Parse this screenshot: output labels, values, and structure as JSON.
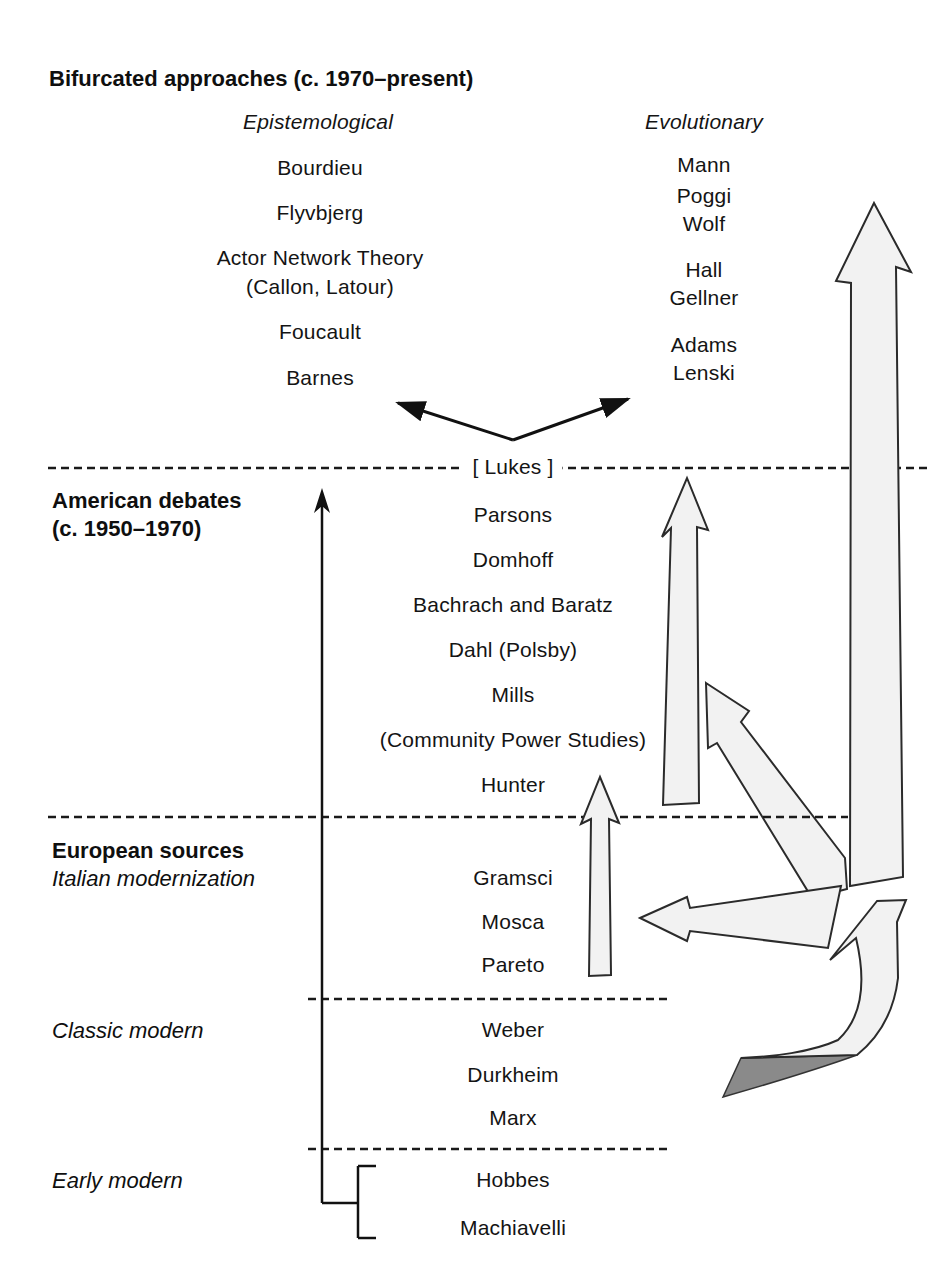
{
  "figure": {
    "title": "Bifurcated approaches (c. 1970–present)",
    "bifurcated": {
      "epistemological": {
        "label": "Epistemological",
        "names": [
          "Bourdieu",
          "Flyvbjerg",
          "Actor Network Theory",
          "(Callon, Latour)",
          "Foucault",
          "Barnes"
        ]
      },
      "evolutionary": {
        "label": "Evolutionary",
        "names": [
          "Mann",
          "Poggi",
          "Wolf",
          "Hall",
          "Gellner",
          "Adams",
          "Lenski"
        ]
      }
    },
    "lukes_label": "[ Lukes ]",
    "american": {
      "label": "American debates",
      "sublabel": "(c. 1950–1970)",
      "names": [
        "Parsons",
        "Domhoff",
        "Bachrach and Baratz",
        "Dahl (Polsby)",
        "Mills",
        "(Community Power Studies)",
        "Hunter"
      ]
    },
    "european": {
      "label": "European sources",
      "sublabel": "Italian modernization",
      "names": [
        "Gramsci",
        "Mosca",
        "Pareto"
      ]
    },
    "classic_modern": {
      "label": "Classic modern",
      "names": [
        "Weber",
        "Durkheim",
        "Marx"
      ]
    },
    "early_modern": {
      "label": "Early modern",
      "names": [
        "Hobbes",
        "Machiavelli"
      ]
    }
  },
  "colors": {
    "arrow_fill": "#f2f2f2",
    "arrow_stroke": "#2b2b2b",
    "dark_tail_fill": "#8a8a8a",
    "line_color": "#1a1a1a",
    "text_color": "#111111"
  }
}
